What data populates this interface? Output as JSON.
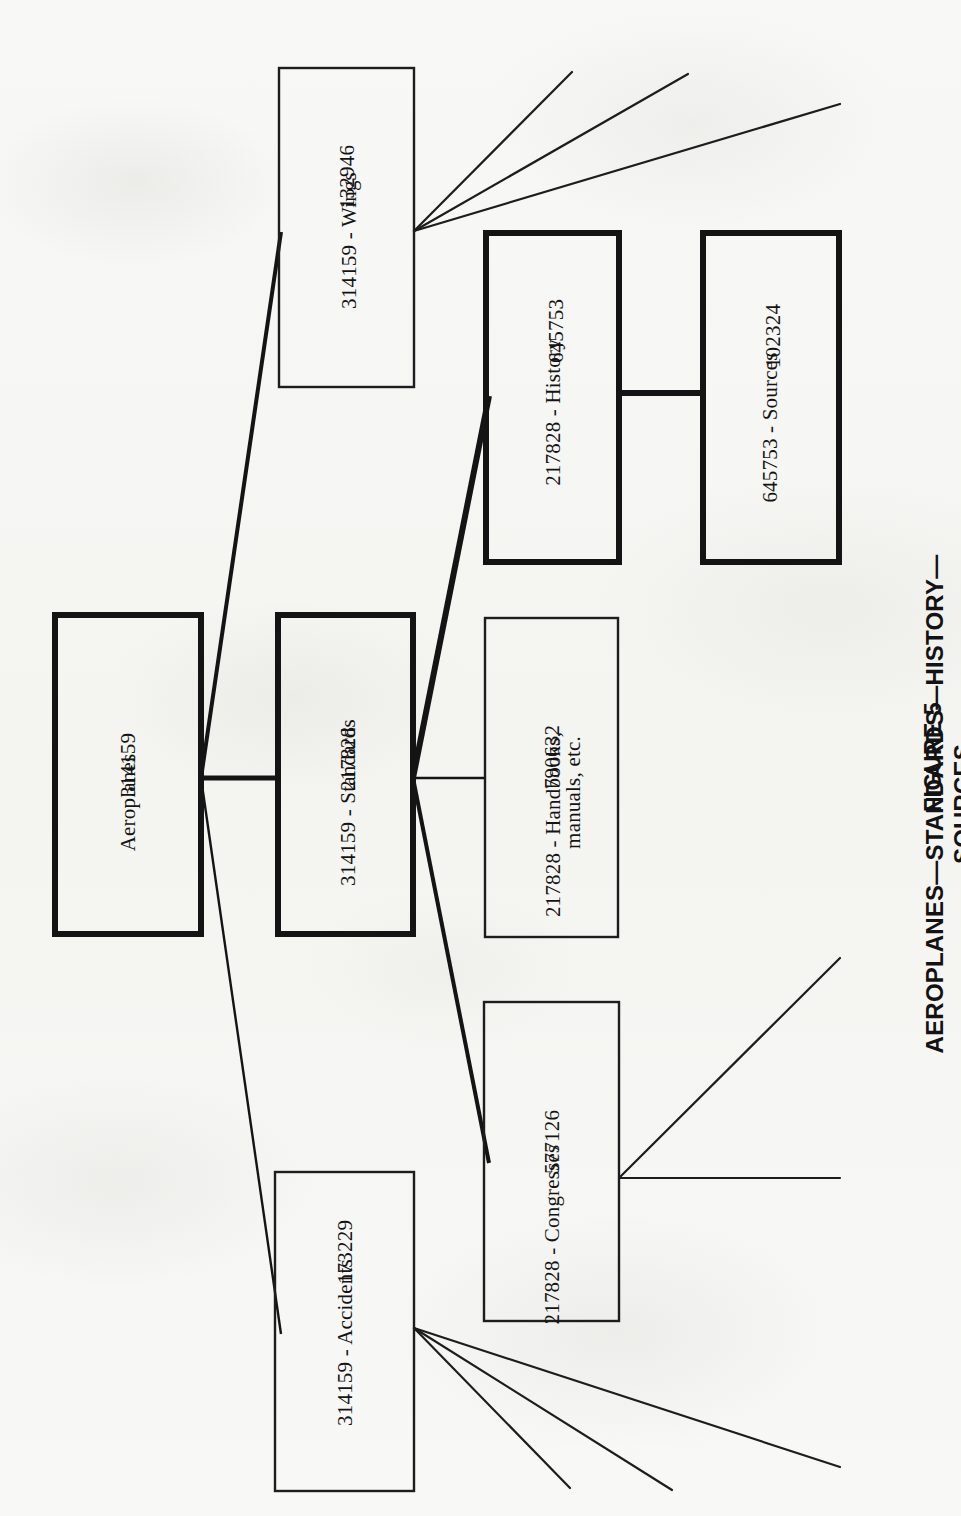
{
  "figure": {
    "number_label": "FIGURE 5",
    "title": "AEROPLANES—STANDARDS—HISTORY—SOURCES"
  },
  "diagram": {
    "orientation": "page rotated 90 degrees (text reads bottom-to-top)",
    "ink_color": "#141414",
    "paper_color": "#f7f7f5",
    "nodes": [
      {
        "id": "aeroplanes",
        "number": "314159",
        "name": "Aeroplanes",
        "emphasis": "heavy",
        "rect": {
          "x": 55,
          "y": 615,
          "w": 146,
          "h": 319
        }
      },
      {
        "id": "standards",
        "number": "217828",
        "name": "314159 - Standards",
        "emphasis": "heavy",
        "rect": {
          "x": 278,
          "y": 615,
          "w": 135,
          "h": 319
        }
      },
      {
        "id": "wings",
        "number": "132946",
        "name": "314159 - Wings",
        "emphasis": "light",
        "rect": {
          "x": 279,
          "y": 68,
          "w": 135,
          "h": 319
        }
      },
      {
        "id": "accidents",
        "number": "173229",
        "name": "314159 - Accidents",
        "emphasis": "light",
        "rect": {
          "x": 275,
          "y": 1172,
          "w": 139,
          "h": 319
        }
      },
      {
        "id": "history",
        "number": "645753",
        "name": "217828 - History",
        "emphasis": "heavy",
        "rect": {
          "x": 486,
          "y": 233,
          "w": 133,
          "h": 329
        }
      },
      {
        "id": "sources",
        "number": "102324",
        "name": "645753 - Sources",
        "emphasis": "heavy",
        "rect": {
          "x": 703,
          "y": 233,
          "w": 136,
          "h": 329
        }
      },
      {
        "id": "handbooks",
        "number": "790632",
        "name": "217828 - Handbooks,",
        "name_line2": "manuals, etc.",
        "emphasis": "light",
        "rect": {
          "x": 485,
          "y": 618,
          "w": 133,
          "h": 319
        }
      },
      {
        "id": "congresses",
        "number": "577126",
        "name": "217828 - Congresses",
        "emphasis": "light",
        "rect": {
          "x": 484,
          "y": 1002,
          "w": 135,
          "h": 319
        }
      }
    ],
    "edges": [
      {
        "from": "aeroplanes",
        "to": "wings",
        "style": "heavy"
      },
      {
        "from": "aeroplanes",
        "to": "standards",
        "style": "heavy"
      },
      {
        "from": "aeroplanes",
        "to": "accidents",
        "style": "light"
      },
      {
        "from": "standards",
        "to": "history",
        "style": "heavy"
      },
      {
        "from": "standards",
        "to": "handbooks",
        "style": "light"
      },
      {
        "from": "standards",
        "to": "congresses",
        "style": "heavy"
      },
      {
        "from": "history",
        "to": "sources",
        "style": "heavy"
      }
    ],
    "fan_lines": {
      "wings_count": 3,
      "accidents_count": 3,
      "congresses_count": 2
    }
  }
}
